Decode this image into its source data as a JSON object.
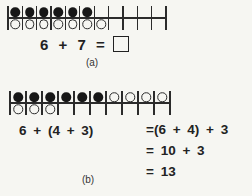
{
  "figure": {
    "background": "#f6f6f2",
    "ink": "#222222"
  },
  "part_a": {
    "strip": {
      "cell_count": 11,
      "top": [
        "F",
        "F",
        "F",
        "F",
        "F",
        "F",
        "",
        "",
        "",
        "",
        ""
      ],
      "bottom": [
        "O",
        "O",
        "O",
        "O",
        "O",
        "O",
        "O",
        "",
        "",
        "",
        ""
      ]
    },
    "equation": "6 + 7 =",
    "label": "(a)"
  },
  "part_b": {
    "strip": {
      "cell_count": 10,
      "top": [
        "F",
        "F",
        "F",
        "F",
        "F",
        "F",
        "O",
        "O",
        "O",
        "O"
      ],
      "bottom": [
        "O",
        "O",
        "O",
        "",
        "",
        "",
        "",
        "",
        "",
        ""
      ]
    },
    "equation_left": "6 + (4 + 3)",
    "steps": [
      "=(6 + 4) + 3",
      "= 10 + 3",
      "= 13"
    ],
    "label": "(b)"
  }
}
